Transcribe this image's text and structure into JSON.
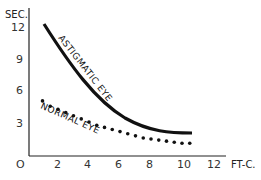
{
  "chart_data": {
    "type": "line",
    "title": "",
    "xlabel": "FT-C.",
    "ylabel": "SEC.",
    "xlim": [
      0,
      13
    ],
    "ylim": [
      0,
      13
    ],
    "x_ticks": [
      "O",
      "2",
      "4",
      "6",
      "8",
      "10",
      "12"
    ],
    "y_ticks": [
      "3",
      "6",
      "9",
      "12"
    ],
    "grid": false,
    "legend": "inline labels",
    "series": [
      {
        "name": "ASTIGMATIC EYE",
        "style": "solid",
        "x": [
          1,
          2,
          3,
          4,
          5,
          6,
          7,
          8,
          9,
          10,
          10.5
        ],
        "y": [
          12.2,
          10.4,
          8.8,
          7.3,
          6.0,
          4.8,
          3.8,
          3.0,
          2.4,
          2.1,
          2.1
        ]
      },
      {
        "name": "NORMAL EYE",
        "style": "dotted",
        "x": [
          1,
          1.5,
          2,
          2.5,
          3,
          3.5,
          4,
          4.5,
          5,
          5.5,
          6,
          6.5,
          7,
          7.5,
          8,
          8.5,
          9,
          9.5,
          10,
          10.5
        ],
        "y": [
          5.2,
          4.7,
          4.4,
          4.1,
          3.8,
          3.5,
          3.2,
          2.9,
          2.7,
          2.5,
          2.3,
          2.1,
          1.9,
          1.7,
          1.6,
          1.5,
          1.4,
          1.3,
          1.2,
          1.2
        ]
      }
    ]
  },
  "labels": {
    "y_axis": "SEC.",
    "x_axis": "FT-C.",
    "origin": "O",
    "astigmatic": "ASTIGMATIC EYE",
    "normal": "NORMAL EYE",
    "x2": "2",
    "x4": "4",
    "x6": "6",
    "x8": "8",
    "x10": "10",
    "x12": "12",
    "y3": "3",
    "y6": "6",
    "y9": "9",
    "y12": "12"
  }
}
